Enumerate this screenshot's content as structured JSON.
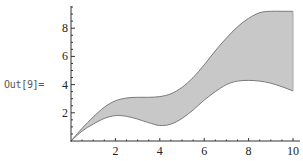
{
  "cell": {
    "out_label": "Out[9]="
  },
  "chart_data": {
    "type": "area",
    "title": "",
    "xlabel": "",
    "ylabel": "",
    "xlim": [
      0,
      10
    ],
    "ylim": [
      0,
      9.5
    ],
    "grid": false,
    "legend": null,
    "x_ticks": [
      "2",
      "4",
      "6",
      "8",
      "10"
    ],
    "y_ticks": [
      "2",
      "4",
      "6",
      "8"
    ],
    "x": [
      0,
      0.5,
      1,
      1.5,
      2,
      2.5,
      3,
      3.5,
      4,
      4.5,
      5,
      5.5,
      6,
      6.5,
      7,
      7.5,
      8,
      8.5,
      9,
      9.5,
      10
    ],
    "series": [
      {
        "name": "upper",
        "values": [
          0,
          0.9,
          1.7,
          2.4,
          2.85,
          3.05,
          3.1,
          3.1,
          3.15,
          3.35,
          3.8,
          4.5,
          5.4,
          6.4,
          7.3,
          8.1,
          8.7,
          9.1,
          9.2,
          9.2,
          9.2
        ]
      },
      {
        "name": "lower",
        "values": [
          0,
          0.7,
          1.2,
          1.6,
          1.8,
          1.75,
          1.55,
          1.3,
          1.1,
          1.2,
          1.6,
          2.2,
          2.9,
          3.5,
          4.0,
          4.25,
          4.3,
          4.25,
          4.1,
          3.85,
          3.55
        ]
      }
    ],
    "fill_between": true,
    "colors": {
      "fill": "#c8c8c8",
      "edge": "#7a7a7a",
      "axis": "#333333"
    }
  }
}
